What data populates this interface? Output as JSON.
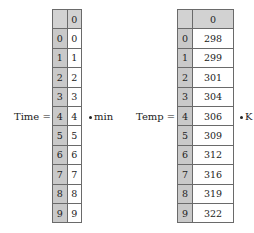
{
  "time": {
    "label": "Time =",
    "unit": "min",
    "column_header": "0",
    "rows": [
      {
        "index": "0",
        "value": "0"
      },
      {
        "index": "1",
        "value": "1"
      },
      {
        "index": "2",
        "value": "2"
      },
      {
        "index": "3",
        "value": "3"
      },
      {
        "index": "4",
        "value": "4"
      },
      {
        "index": "5",
        "value": "5"
      },
      {
        "index": "6",
        "value": "6"
      },
      {
        "index": "7",
        "value": "7"
      },
      {
        "index": "8",
        "value": "8"
      },
      {
        "index": "9",
        "value": "9"
      }
    ]
  },
  "temp": {
    "label": "Temp =",
    "unit": "K",
    "column_header": "0",
    "rows": [
      {
        "index": "0",
        "value": "298"
      },
      {
        "index": "1",
        "value": "299"
      },
      {
        "index": "2",
        "value": "301"
      },
      {
        "index": "3",
        "value": "304"
      },
      {
        "index": "4",
        "value": "306"
      },
      {
        "index": "5",
        "value": "309"
      },
      {
        "index": "6",
        "value": "312"
      },
      {
        "index": "7",
        "value": "316"
      },
      {
        "index": "8",
        "value": "319"
      },
      {
        "index": "9",
        "value": "322"
      }
    ]
  }
}
